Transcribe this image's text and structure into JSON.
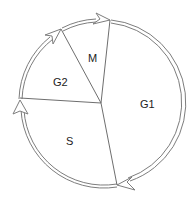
{
  "diagram": {
    "title": "",
    "type": "cell-cycle",
    "phases": [
      {
        "id": "G1",
        "label": "G1"
      },
      {
        "id": "S",
        "label": "S"
      },
      {
        "id": "G2",
        "label": "G2"
      },
      {
        "id": "M",
        "label": "M"
      }
    ],
    "colors": {
      "stroke": "#7a7a7a",
      "text": "#222222",
      "background": "#ffffff"
    }
  }
}
